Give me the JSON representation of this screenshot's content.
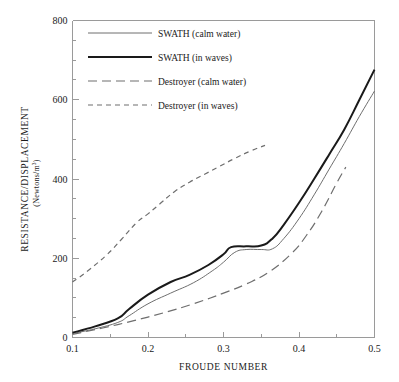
{
  "chart_data": {
    "type": "line",
    "title": "",
    "xlabel": "FROUDE NUMBER",
    "ylabel": "RESISTANCE/DISPLACEMENT",
    "ylabel_units": "(Newtons/m",
    "ylabel_units_exp": "3",
    "ylabel_units_close": ")",
    "xlim": [
      0.1,
      0.5
    ],
    "ylim": [
      0,
      800
    ],
    "xticks": [
      0.1,
      0.2,
      0.3,
      0.4,
      0.5
    ],
    "xticklabels": [
      "0.1",
      "0.2",
      "0.3",
      "0.4",
      "0.5"
    ],
    "yticks": [
      0,
      200,
      400,
      600,
      800
    ],
    "yticklabels": [
      "0",
      "200",
      "400",
      "600",
      "800"
    ],
    "yminorticks": [
      50,
      100,
      150,
      250,
      300,
      350,
      450,
      500,
      550,
      650,
      700,
      750
    ],
    "xminorticks": [
      0.15,
      0.25,
      0.35,
      0.45
    ],
    "grid": false,
    "legend_position": "upper-left-inside",
    "series": [
      {
        "name": "SWATH (calm water)",
        "style": "solid-thin",
        "color": "#6e6e6e",
        "width": 1.0,
        "x": [
          0.1,
          0.13,
          0.16,
          0.175,
          0.2,
          0.23,
          0.26,
          0.285,
          0.3,
          0.315,
          0.33,
          0.35,
          0.365,
          0.38,
          0.4,
          0.42,
          0.44,
          0.46,
          0.48,
          0.5
        ],
        "y": [
          10,
          22,
          38,
          55,
          85,
          112,
          138,
          168,
          190,
          215,
          222,
          222,
          224,
          250,
          300,
          360,
          425,
          490,
          558,
          622
        ]
      },
      {
        "name": "SWATH (in waves)",
        "style": "solid-thick",
        "color": "#1a1a1a",
        "width": 2.0,
        "x": [
          0.1,
          0.13,
          0.16,
          0.175,
          0.2,
          0.23,
          0.255,
          0.28,
          0.3,
          0.31,
          0.33,
          0.35,
          0.365,
          0.38,
          0.4,
          0.42,
          0.44,
          0.46,
          0.48,
          0.5
        ],
        "y": [
          12,
          28,
          48,
          72,
          108,
          140,
          158,
          183,
          210,
          228,
          230,
          232,
          250,
          285,
          340,
          400,
          462,
          525,
          600,
          676
        ]
      },
      {
        "name": "Destroyer (calm water)",
        "style": "dashed-long",
        "color": "#6e6e6e",
        "width": 1.2,
        "dash": "9,5",
        "x": [
          0.1,
          0.14,
          0.18,
          0.22,
          0.26,
          0.3,
          0.33,
          0.36,
          0.39,
          0.41,
          0.43,
          0.45,
          0.462
        ],
        "y": [
          8,
          24,
          42,
          62,
          85,
          112,
          135,
          165,
          212,
          258,
          318,
          390,
          430
        ]
      },
      {
        "name": "Destroyer (in waves)",
        "style": "dashed-short",
        "color": "#6e6e6e",
        "width": 1.2,
        "dash": "5,4",
        "x": [
          0.1,
          0.12,
          0.145,
          0.165,
          0.185,
          0.2,
          0.215,
          0.235,
          0.255,
          0.275,
          0.295,
          0.315,
          0.335,
          0.355
        ],
        "y": [
          140,
          168,
          208,
          248,
          290,
          312,
          336,
          368,
          392,
          412,
          432,
          452,
          470,
          485
        ]
      }
    ]
  },
  "legend": {
    "items": [
      {
        "label": "SWATH (calm water)"
      },
      {
        "label": "SWATH (in waves)"
      },
      {
        "label": "Destroyer (calm water)"
      },
      {
        "label": "Destroyer (in waves)"
      }
    ]
  }
}
